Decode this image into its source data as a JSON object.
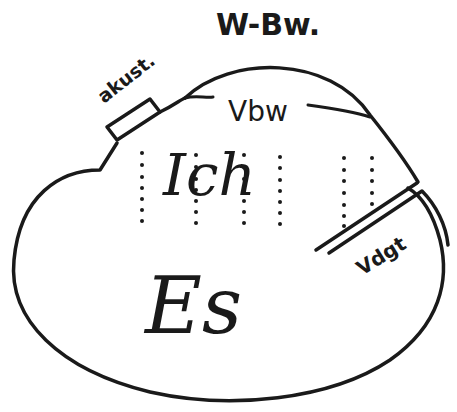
{
  "diagram": {
    "labels": {
      "top": "W-Bw.",
      "acoustic": "akust.",
      "preconscious": "Vbw",
      "ego": "Ich",
      "id": "Es",
      "repressed": "Vdgt"
    },
    "colors": {
      "ink": "#1a1a1a",
      "paper": "#ffffff"
    },
    "dotted_columns": 6
  }
}
